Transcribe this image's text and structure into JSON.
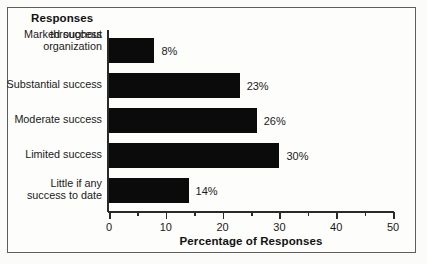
{
  "figure": {
    "legend_title": "Responses",
    "axis_title": "Percentage of Responses"
  },
  "chart_data": {
    "type": "bar",
    "orientation": "horizontal",
    "title": "",
    "subtitle": "",
    "xlabel": "Percentage of Responses",
    "ylabel": "Responses",
    "xlim": [
      0,
      50
    ],
    "xticks": [
      0,
      10,
      20,
      30,
      40,
      50
    ],
    "xtick_labels": [
      "0",
      "10",
      "20",
      "30",
      "40",
      "50"
    ],
    "minor_xticks": [
      5,
      15,
      25,
      35,
      45
    ],
    "grid": false,
    "legend": false,
    "bar_color": "#0b0b0b",
    "categories": [
      "Marked success throughout organization",
      "Substantial success",
      "Moderate success",
      "Limited success",
      "Little if any success to date"
    ],
    "category_lines": [
      [
        "Marked success",
        "throughout",
        "organization"
      ],
      [
        "Substantial success"
      ],
      [
        "Moderate success"
      ],
      [
        "Limited success"
      ],
      [
        "Little if any",
        "success to date"
      ]
    ],
    "values": [
      8,
      23,
      26,
      30,
      14
    ],
    "data_labels": [
      "8%",
      "23%",
      "26%",
      "30%",
      "14%"
    ]
  }
}
